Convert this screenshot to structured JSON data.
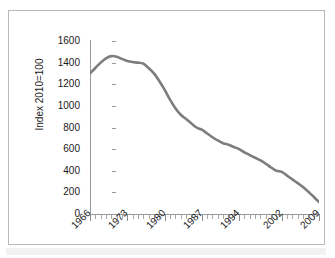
{
  "chart_data": {
    "type": "line",
    "title": "",
    "subtitle": "",
    "xlabel": "",
    "ylabel": "Index 2010=100",
    "xlim": [
      1966,
      2009
    ],
    "ylim": [
      0,
      1600
    ],
    "y_ticks": [
      1600,
      1400,
      1200,
      1000,
      800,
      600,
      400,
      200,
      0
    ],
    "y_tick_labels": [
      "1600",
      "1400",
      "1200",
      "1000",
      "800",
      "600",
      "400",
      "200",
      "0"
    ],
    "x_tick_labels": [
      "1966",
      "1973",
      "1980",
      "1987",
      "1994",
      "2002",
      "2009"
    ],
    "x_tick_years": [
      1966,
      1973,
      1980,
      1987,
      1994,
      2002,
      2009
    ],
    "x_minor_tick_interval": 1,
    "grid": false,
    "legend": false,
    "legend_position": "none",
    "series": [
      {
        "name": "Index",
        "color": "#7d7d7d",
        "line_width": 2.6,
        "x": [
          1966,
          1967,
          1968,
          1969,
          1970,
          1971,
          1972,
          1973,
          1974,
          1975,
          1976,
          1977,
          1978,
          1979,
          1980,
          1981,
          1982,
          1983,
          1984,
          1985,
          1986,
          1987,
          1988,
          1989,
          1990,
          1991,
          1992,
          1993,
          1994,
          1995,
          1996,
          1997,
          1998,
          1999,
          2000,
          2001,
          2002,
          2003,
          2004,
          2005,
          2006,
          2007,
          2008,
          2009
        ],
        "values": [
          1300,
          1350,
          1400,
          1440,
          1460,
          1455,
          1435,
          1415,
          1405,
          1400,
          1390,
          1350,
          1300,
          1230,
          1150,
          1060,
          980,
          920,
          880,
          840,
          800,
          780,
          745,
          710,
          680,
          655,
          640,
          620,
          600,
          570,
          545,
          520,
          495,
          465,
          430,
          400,
          390,
          355,
          320,
          285,
          250,
          205,
          160,
          110
        ]
      }
    ],
    "annotations": []
  },
  "axes": {
    "y_title": "Index 2010=100"
  },
  "colors": {
    "line": "#7d7d7d",
    "axis": "#9a9a9a",
    "frame": "#b9b9b9",
    "text": "#1a1a1a",
    "background": "#ffffff"
  }
}
